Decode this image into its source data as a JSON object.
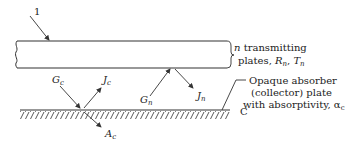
{
  "figure": {
    "callout_number": "1",
    "plates_label": {
      "line1_var": "n",
      "line1_text": " transmitting",
      "line2_text": "plates, ",
      "R": "R",
      "R_sub": "n",
      "sep": ", ",
      "T": "T",
      "T_sub": "n"
    },
    "absorber_label": {
      "line1": "Opaque absorber",
      "line2": "(collector) plate",
      "line3": "with absorptivity, ",
      "alpha": "α",
      "alpha_sub": "c"
    },
    "collector_symbol": "C",
    "fluxes": {
      "Gc": {
        "main": "G",
        "sub": "c"
      },
      "Jc": {
        "main": "J",
        "sub": "c"
      },
      "Ac": {
        "main": "A",
        "sub": "c"
      },
      "Gn": {
        "main": "G",
        "sub": "n"
      },
      "Jn": {
        "main": "J",
        "sub": "n"
      }
    },
    "colors": {
      "line": "#333333",
      "text": "#222222"
    }
  }
}
